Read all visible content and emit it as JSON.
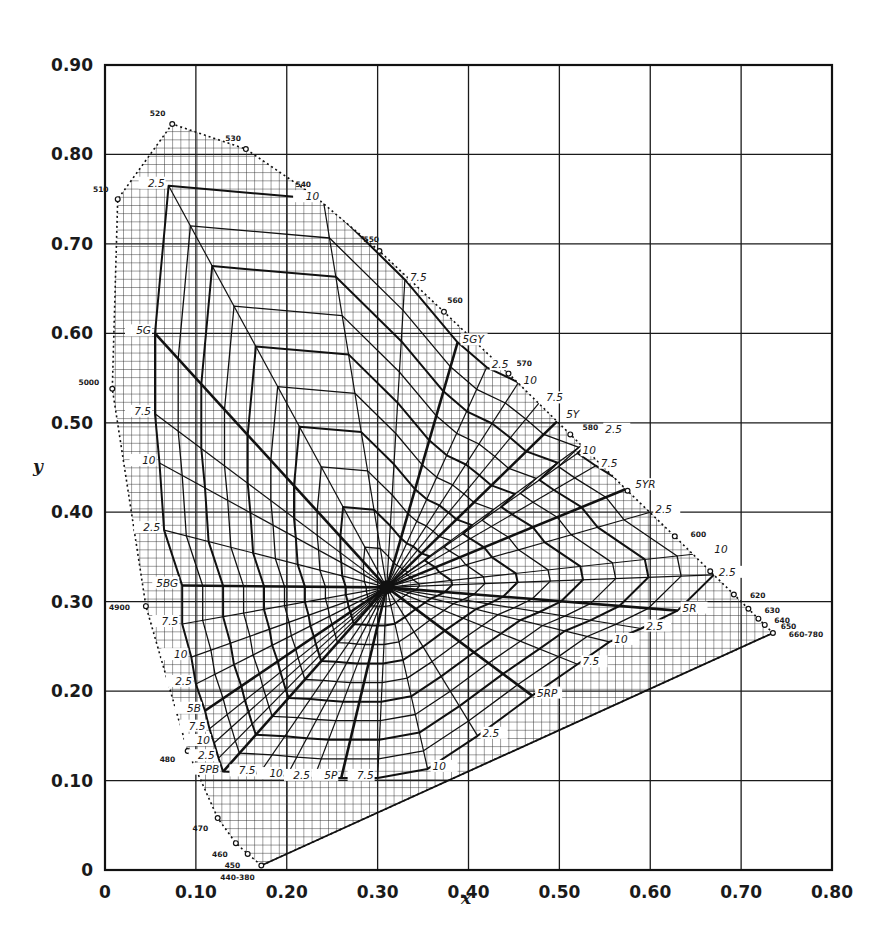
{
  "chart_data": {
    "type": "scatter",
    "title": "",
    "xlabel": "x",
    "ylabel": "y",
    "xlim": [
      0,
      0.8
    ],
    "ylim": [
      0,
      0.9
    ],
    "grid": true,
    "legend": null,
    "x_ticks": [
      "0",
      "0.10",
      "0.20",
      "0.30",
      "0.40",
      "0.50",
      "0.60",
      "0.70",
      "0.80"
    ],
    "y_ticks": [
      "0",
      "0.10",
      "0.20",
      "0.30",
      "0.40",
      "0.50",
      "0.60",
      "0.70",
      "0.80",
      "0.90"
    ],
    "white_point": {
      "x": 0.31,
      "y": 0.316
    },
    "spectral_locus": [
      {
        "label": "440-380",
        "x": 0.172,
        "y": 0.005
      },
      {
        "label": "450",
        "x": 0.157,
        "y": 0.018
      },
      {
        "label": "460",
        "x": 0.144,
        "y": 0.03
      },
      {
        "label": "470",
        "x": 0.124,
        "y": 0.058
      },
      {
        "label": "480",
        "x": 0.091,
        "y": 0.133
      },
      {
        "label": "4900",
        "x": 0.045,
        "y": 0.295
      },
      {
        "label": "5000",
        "x": 0.008,
        "y": 0.538
      },
      {
        "label": "510",
        "x": 0.014,
        "y": 0.75
      },
      {
        "label": "520",
        "x": 0.074,
        "y": 0.834
      },
      {
        "label": "530",
        "x": 0.155,
        "y": 0.806
      },
      {
        "label": "540",
        "x": 0.23,
        "y": 0.754
      },
      {
        "label": "550",
        "x": 0.302,
        "y": 0.692
      },
      {
        "label": "560",
        "x": 0.373,
        "y": 0.624
      },
      {
        "label": "570",
        "x": 0.444,
        "y": 0.555
      },
      {
        "label": "580",
        "x": 0.512,
        "y": 0.487
      },
      {
        "label": "590",
        "x": 0.575,
        "y": 0.424
      },
      {
        "label": "600",
        "x": 0.627,
        "y": 0.373
      },
      {
        "label": "610",
        "x": 0.666,
        "y": 0.334
      },
      {
        "label": "620",
        "x": 0.692,
        "y": 0.308
      },
      {
        "label": "630",
        "x": 0.708,
        "y": 0.292
      },
      {
        "label": "640",
        "x": 0.719,
        "y": 0.281
      },
      {
        "label": "650",
        "x": 0.726,
        "y": 0.274
      },
      {
        "label": "660-780",
        "x": 0.735,
        "y": 0.265
      }
    ],
    "munsell_hue_labels": [
      {
        "label": "5G",
        "x": 0.055,
        "y": 0.6,
        "principal": true
      },
      {
        "label": "7.5",
        "x": 0.055,
        "y": 0.51
      },
      {
        "label": "10",
        "x": 0.06,
        "y": 0.455
      },
      {
        "label": "2.5",
        "x": 0.065,
        "y": 0.38
      },
      {
        "label": "5BG",
        "x": 0.085,
        "y": 0.318,
        "principal": true
      },
      {
        "label": "7.5",
        "x": 0.085,
        "y": 0.275
      },
      {
        "label": "10",
        "x": 0.095,
        "y": 0.238
      },
      {
        "label": "2.5",
        "x": 0.1,
        "y": 0.208
      },
      {
        "label": "5B",
        "x": 0.11,
        "y": 0.178,
        "principal": true
      },
      {
        "label": "7.5",
        "x": 0.115,
        "y": 0.158
      },
      {
        "label": "10",
        "x": 0.12,
        "y": 0.142
      },
      {
        "label": "2.5",
        "x": 0.125,
        "y": 0.125
      },
      {
        "label": "5PB",
        "x": 0.13,
        "y": 0.11,
        "principal": true
      },
      {
        "label": "7.5",
        "x": 0.17,
        "y": 0.108
      },
      {
        "label": "10",
        "x": 0.2,
        "y": 0.105
      },
      {
        "label": "2.5",
        "x": 0.23,
        "y": 0.103
      },
      {
        "label": "5P",
        "x": 0.26,
        "y": 0.103,
        "principal": true
      },
      {
        "label": "7.5",
        "x": 0.3,
        "y": 0.103
      },
      {
        "label": "10",
        "x": 0.355,
        "y": 0.113
      },
      {
        "label": "2.5",
        "x": 0.41,
        "y": 0.15
      },
      {
        "label": "5RP",
        "x": 0.47,
        "y": 0.195,
        "principal": true
      },
      {
        "label": "7.5",
        "x": 0.52,
        "y": 0.23
      },
      {
        "label": "10",
        "x": 0.555,
        "y": 0.255
      },
      {
        "label": "2.5",
        "x": 0.59,
        "y": 0.27
      },
      {
        "label": "5R",
        "x": 0.63,
        "y": 0.29,
        "principal": true
      },
      {
        "label": "2.5",
        "x": 0.67,
        "y": 0.33
      },
      {
        "label": "10",
        "x": 0.665,
        "y": 0.355
      },
      {
        "label": "2.5",
        "x": 0.6,
        "y": 0.4
      },
      {
        "label": "5YR",
        "x": 0.578,
        "y": 0.428,
        "principal": true
      },
      {
        "label": "7.5",
        "x": 0.54,
        "y": 0.452
      },
      {
        "label": "10",
        "x": 0.52,
        "y": 0.466
      },
      {
        "label": "2.5",
        "x": 0.545,
        "y": 0.49
      },
      {
        "label": "5Y",
        "x": 0.502,
        "y": 0.506,
        "principal": true
      },
      {
        "label": "7.5",
        "x": 0.48,
        "y": 0.525
      },
      {
        "label": "10",
        "x": 0.455,
        "y": 0.545
      },
      {
        "label": "2.5",
        "x": 0.42,
        "y": 0.562
      },
      {
        "label": "5GY",
        "x": 0.388,
        "y": 0.59,
        "principal": true
      },
      {
        "label": "7.5",
        "x": 0.33,
        "y": 0.66
      },
      {
        "label": "10",
        "x": 0.24,
        "y": 0.75
      },
      {
        "label": "2.5",
        "x": 0.07,
        "y": 0.765
      }
    ],
    "munsell_chroma_loci_count": 10
  },
  "axes": {
    "x_title": "x",
    "y_title": "y"
  }
}
